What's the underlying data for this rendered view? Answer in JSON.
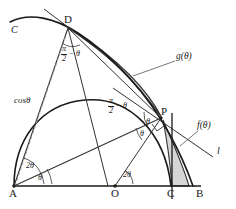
{
  "figure": {
    "canvas": {
      "width": 236,
      "height": 209,
      "background": "#ffffff"
    },
    "colors": {
      "stroke": "#1a1a1a",
      "thin_stroke": "#555555",
      "dashed_stroke": "#999999",
      "shade_fill": "#d6d6d6",
      "shade_stroke": "#333333",
      "label_color": "#1a1a1a"
    },
    "points": [
      {
        "name": "A",
        "label": "A",
        "x": 14,
        "y": 186
      },
      {
        "name": "O",
        "label": "O",
        "x": 115,
        "y": 186
      },
      {
        "name": "C",
        "label": "C",
        "x": 172,
        "y": 186
      },
      {
        "name": "B",
        "label": "B",
        "x": 201,
        "y": 186
      },
      {
        "name": "D",
        "label": "D",
        "x": 68,
        "y": 28
      },
      {
        "name": "P",
        "label": "P",
        "x": 160,
        "y": 117
      }
    ],
    "curve_labels": [
      {
        "name": "circle-C",
        "label": "C",
        "x": 14,
        "y": 31
      },
      {
        "name": "tangent-line-l",
        "label": "l",
        "x": 219,
        "y": 152
      }
    ],
    "region_labels": [
      {
        "name": "region-g",
        "label": "g(θ)",
        "x": 177,
        "y": 57
      },
      {
        "name": "region-f",
        "label": "f(θ)",
        "x": 199,
        "y": 127
      }
    ],
    "segment_labels": [
      {
        "name": "cos-theta",
        "label": "cosθ",
        "x": 18,
        "y": 101
      }
    ],
    "angle_labels": [
      {
        "name": "angle-2theta-at-A",
        "label": "2θ",
        "x": 29,
        "y": 167
      },
      {
        "name": "angle-theta-at-A",
        "label": "θ",
        "x": 36,
        "y": 179
      },
      {
        "name": "angle-2theta-at-O",
        "label": "2θ",
        "x": 122,
        "y": 176
      },
      {
        "name": "angle-theta-at-P-upper",
        "label": "θ",
        "x": 146,
        "y": 123
      },
      {
        "name": "angle-theta-at-P-lower",
        "label": "θ",
        "x": 140,
        "y": 134
      }
    ],
    "fraction_angle_labels": [
      {
        "name": "angle-half-pi-minus-theta-at-D",
        "numerator": "π",
        "denominator": "2",
        "rest": "− θ",
        "x": 63,
        "y": 52
      },
      {
        "name": "angle-half-pi-minus-theta-at-P",
        "numerator": "π",
        "denominator": "2",
        "rest": "− θ",
        "x": 110,
        "y": 104
      }
    ],
    "geometry_notes": {
      "big_circle_center": "A",
      "big_circle_radius": 187,
      "small_circle_center": "O",
      "small_circle_radius": 57
    }
  }
}
